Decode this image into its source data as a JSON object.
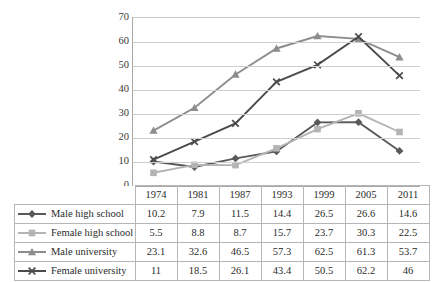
{
  "chart_data": {
    "type": "line",
    "title": "",
    "xlabel": "",
    "ylabel": "",
    "categories": [
      "1974",
      "1981",
      "1987",
      "1993",
      "1999",
      "2005",
      "2011"
    ],
    "ylim": [
      0,
      70
    ],
    "yticks": [
      0,
      10,
      20,
      30,
      40,
      50,
      60,
      70
    ],
    "grid": true,
    "legend_position": "table-left-column",
    "series": [
      {
        "name": "Male high school",
        "values": [
          10.2,
          7.9,
          11.5,
          14.4,
          26.5,
          26.6,
          14.6
        ],
        "color": "#5a5a5a",
        "marker": "diamond"
      },
      {
        "name": "Female high school",
        "values": [
          5.5,
          8.8,
          8.7,
          15.7,
          23.7,
          30.3,
          22.5
        ],
        "color": "#b4b4b4",
        "marker": "square"
      },
      {
        "name": "Male university",
        "values": [
          23.1,
          32.6,
          46.5,
          57.3,
          62.5,
          61.3,
          53.7
        ],
        "color": "#8d8d8d",
        "marker": "triangle"
      },
      {
        "name": "Female university",
        "values": [
          11,
          18.5,
          26.1,
          43.4,
          50.5,
          62.2,
          46
        ],
        "color": "#4b4b4b",
        "marker": "cross"
      }
    ]
  },
  "table": {
    "header_blank": "",
    "columns": [
      "1974",
      "1981",
      "1987",
      "1993",
      "1999",
      "2005",
      "2011"
    ],
    "rows": [
      {
        "label": "Male high school",
        "values": [
          "10.2",
          "7.9",
          "11.5",
          "14.4",
          "26.5",
          "26.6",
          "14.6"
        ]
      },
      {
        "label": "Female high school",
        "values": [
          "5.5",
          "8.8",
          "8.7",
          "15.7",
          "23.7",
          "30.3",
          "22.5"
        ]
      },
      {
        "label": "Male university",
        "values": [
          "23.1",
          "32.6",
          "46.5",
          "57.3",
          "62.5",
          "61.3",
          "53.7"
        ]
      },
      {
        "label": "Female university",
        "values": [
          "11",
          "18.5",
          "26.1",
          "43.4",
          "50.5",
          "62.2",
          "46"
        ]
      }
    ]
  },
  "axis": {
    "y_labels": [
      "70",
      "60",
      "50",
      "40",
      "30",
      "20",
      "10",
      "0"
    ]
  }
}
